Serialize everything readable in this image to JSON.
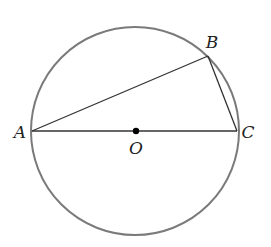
{
  "diagram": {
    "type": "geometry",
    "circle": {
      "center": "O",
      "cx": 135,
      "cy": 131,
      "r": 104,
      "stroke": "#7a7a7a"
    },
    "points": {
      "A": {
        "x": 32,
        "y": 131,
        "label": "A",
        "label_x": 20,
        "label_y": 138
      },
      "B": {
        "x": 208,
        "y": 56,
        "label": "B",
        "label_x": 212,
        "label_y": 48
      },
      "C": {
        "x": 237,
        "y": 131,
        "label": "C",
        "label_x": 248,
        "label_y": 138
      },
      "O": {
        "x": 136,
        "y": 131,
        "label": "O",
        "label_x": 136,
        "label_y": 154
      }
    },
    "segments": [
      {
        "from": "A",
        "to": "B"
      },
      {
        "from": "B",
        "to": "C"
      },
      {
        "from": "A",
        "to": "C"
      }
    ],
    "line_color": "#333333"
  }
}
